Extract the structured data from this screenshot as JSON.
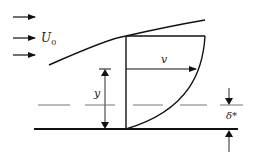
{
  "diagram": {
    "labels": {
      "freestream_velocity": "U",
      "freestream_subscript": "0",
      "local_velocity": "v",
      "height": "y",
      "displacement_thickness": "δ*"
    },
    "colors": {
      "line": "#111111",
      "dashed": "#555555",
      "background": "#ffffff"
    },
    "freestream_arrows": 3
  }
}
